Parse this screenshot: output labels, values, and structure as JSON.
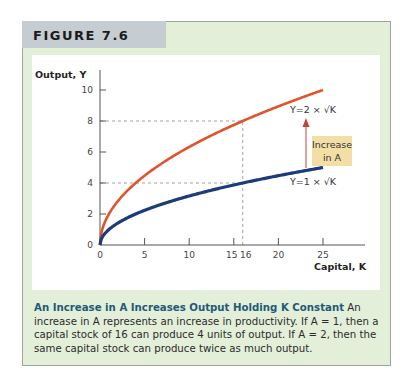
{
  "figure": {
    "label": "FIGURE 7.6",
    "caption_title": "An Increase in A Increases Output Holding K Constant",
    "caption_body": "An increase in A represents an increase in productivity. If A = 1, then a capital stock of 16 can produce 4 units of output. If A = 2, then the same capital stock can produce twice as much output."
  },
  "colors": {
    "frame_bg": "#e3efd8",
    "tab_bg": "#c5ccd2",
    "orange_curve": "#e0532b",
    "blue_curve": "#1d3a7a",
    "arrow": "#c4443a",
    "annotation_box": "#f3dfa6",
    "caption_title": "#1f5a78"
  },
  "chart_data": {
    "type": "line",
    "title": "",
    "xlabel": "Capital, K",
    "ylabel": "Output, Y",
    "xlim": [
      0,
      25
    ],
    "ylim": [
      0,
      10
    ],
    "x_ticks": [
      0,
      5,
      10,
      15,
      16,
      20,
      25
    ],
    "y_ticks": [
      0,
      2,
      4,
      6,
      8,
      10
    ],
    "grid": false,
    "series": [
      {
        "name": "Y=2 × √K",
        "formula": "Y = 2*sqrt(K)",
        "color": "#e0532b",
        "x": [
          0,
          1,
          4,
          9,
          16,
          25
        ],
        "values": [
          0,
          2,
          4,
          6,
          8,
          10
        ]
      },
      {
        "name": "Y=1 × √K",
        "formula": "Y = 1*sqrt(K)",
        "color": "#1d3a7a",
        "x": [
          0,
          1,
          4,
          9,
          16,
          25
        ],
        "values": [
          0,
          1,
          2,
          3,
          4,
          5
        ]
      }
    ],
    "reference_lines": [
      {
        "type": "horizontal",
        "y": 8,
        "x_to": 16,
        "style": "dashed"
      },
      {
        "type": "horizontal",
        "y": 4,
        "x_to": 16,
        "style": "dashed"
      },
      {
        "type": "vertical",
        "x": 16,
        "y_to": 8,
        "style": "dashed"
      }
    ],
    "annotations": [
      {
        "text": "Increase in A",
        "type": "arrow",
        "from": [
          24,
          5
        ],
        "to": [
          24,
          9.8
        ]
      },
      {
        "text": "Y=2 × √K",
        "at": [
          24,
          9.4
        ]
      },
      {
        "text": "Y=1 × √K",
        "at": [
          24,
          4.5
        ]
      }
    ]
  },
  "labels": {
    "y_axis": "Output, Y",
    "x_axis": "Capital, K",
    "eq_top": "Y=2 × √K",
    "eq_bottom": "Y=1 × √K",
    "increase_line1": "Increase",
    "increase_line2": "in A",
    "x_ticks": [
      "0",
      "5",
      "10",
      "15",
      "16",
      "20",
      "25"
    ],
    "y_ticks": [
      "0",
      "2",
      "4",
      "6",
      "8",
      "10"
    ]
  }
}
